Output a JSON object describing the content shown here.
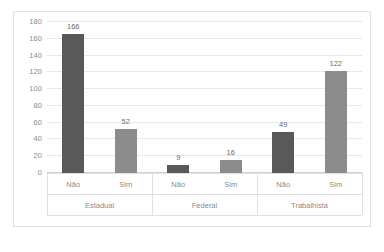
{
  "chart_data": {
    "type": "bar",
    "title": "",
    "xlabel": "",
    "ylabel": "",
    "ylim": [
      0,
      180
    ],
    "ytick_step": 20,
    "yticks": [
      180,
      160,
      140,
      120,
      100,
      80,
      60,
      40,
      20,
      0
    ],
    "grid": true,
    "legend": "none",
    "categories": [
      "Não",
      "Sim",
      "Não",
      "Sim",
      "Não",
      "Sim"
    ],
    "groups": [
      {
        "name": "Estadual",
        "categories": [
          "Não",
          "Sim"
        ],
        "values": [
          166,
          52
        ]
      },
      {
        "name": "Federal",
        "categories": [
          "Não",
          "Sim"
        ],
        "values": [
          9,
          16
        ]
      },
      {
        "name": "Trabalhista",
        "categories": [
          "Não",
          "Sim"
        ],
        "values": [
          49,
          122
        ]
      }
    ],
    "bars": [
      {
        "group": "Estadual",
        "category": "Não",
        "value": 166,
        "label": "166",
        "color": "#595959"
      },
      {
        "group": "Estadual",
        "category": "Sim",
        "value": 52,
        "label": "52",
        "color": "#8c8c8c"
      },
      {
        "group": "Federal",
        "category": "Não",
        "value": 9,
        "label": "9",
        "color": "#595959"
      },
      {
        "group": "Federal",
        "category": "Sim",
        "value": 16,
        "label": "16",
        "color": "#8c8c8c"
      },
      {
        "group": "Trabalhista",
        "category": "Não",
        "value": 49,
        "label": "49",
        "color": "#595959"
      },
      {
        "group": "Trabalhista",
        "category": "Sim",
        "value": 122,
        "label": "122",
        "color": "#8c8c8c"
      }
    ],
    "values": [
      166,
      52,
      9,
      16,
      49,
      122
    ],
    "colors": {
      "bar_nao": "#595959",
      "bar_sim": "#8c8c8c",
      "gridline": "#e8e8e8",
      "axis": "#d2d2d2",
      "border": "#e3e3e3",
      "text": "#8b8b8b",
      "value_text": "#6e6e6e",
      "background": "#ffffff"
    }
  }
}
